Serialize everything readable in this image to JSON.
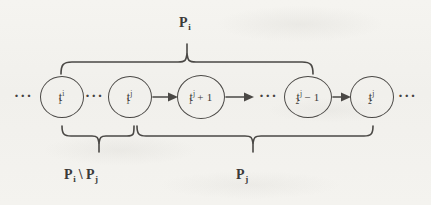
{
  "figure": {
    "type": "chain-diagram",
    "ink_color": "#4a4845",
    "paper_color": "#f3f2ee"
  },
  "nodes": [
    {
      "id": "node-t1-i",
      "base": "t",
      "sub": "1",
      "sup": "i",
      "op": "",
      "cx": 62,
      "rx": 22,
      "ry": 21
    },
    {
      "id": "node-t1-j",
      "base": "t",
      "sub": "1",
      "sup": "j",
      "op": "",
      "cx": 130,
      "rx": 22,
      "ry": 21
    },
    {
      "id": "node-t1-j-plus-1",
      "base": "t",
      "sub": "1",
      "sup": "j",
      "op": "+ 1",
      "cx": 201,
      "rx": 24,
      "ry": 22
    },
    {
      "id": "node-t2-j-minus-1",
      "base": "t",
      "sub": "2",
      "sup": "j",
      "op": "− 1",
      "cx": 308,
      "rx": 24,
      "ry": 21
    },
    {
      "id": "node-t2-j",
      "base": "t",
      "sub": "2",
      "sup": "j",
      "op": "",
      "cx": 372,
      "rx": 22,
      "ry": 21
    }
  ],
  "ellipses": [
    {
      "id": "ellipsis-leading",
      "text": "···",
      "x": 20,
      "y": 87
    },
    {
      "id": "ellipsis-between-1-2",
      "text": "···",
      "x": 89,
      "y": 87
    },
    {
      "id": "ellipsis-before-4",
      "text": "···",
      "x": 261,
      "y": 87
    },
    {
      "id": "ellipsis-trailing",
      "text": "···",
      "x": 399,
      "y": 87
    }
  ],
  "arrows": [
    {
      "id": "arrow-t1j-to-plus1",
      "x1": 153,
      "x2": 176,
      "y": 97
    },
    {
      "id": "arrow-plus1-to-dots",
      "x1": 226,
      "x2": 253,
      "y": 97
    },
    {
      "id": "arrow-minus1-to-t2j",
      "x1": 333,
      "x2": 349,
      "y": 97
    }
  ],
  "braces": [
    {
      "id": "brace-top-pi",
      "orientation": "up",
      "x_start": 61,
      "x_end": 313,
      "label_id": "label-pi"
    },
    {
      "id": "brace-bottom-pi-minus-pj",
      "orientation": "down",
      "x_start": 62,
      "x_end": 134,
      "label_id": "label-pi-minus-pj"
    },
    {
      "id": "brace-bottom-pj",
      "orientation": "down",
      "x_start": 137,
      "x_end": 373,
      "label_id": "label-pj"
    }
  ],
  "labels": {
    "top": {
      "id": "label-pi",
      "base": "P",
      "sub": "i",
      "text": "P",
      "x": 186,
      "y": 12
    },
    "bottom_left": {
      "id": "label-pi-minus-pj",
      "first_base": "P",
      "first_sub": "i",
      "operator": "\\",
      "second_base": "P",
      "second_sub": "j",
      "x": 68,
      "y": 172
    },
    "bottom_right": {
      "id": "label-pj",
      "base": "P",
      "sub": "j",
      "x": 238,
      "y": 172
    }
  }
}
